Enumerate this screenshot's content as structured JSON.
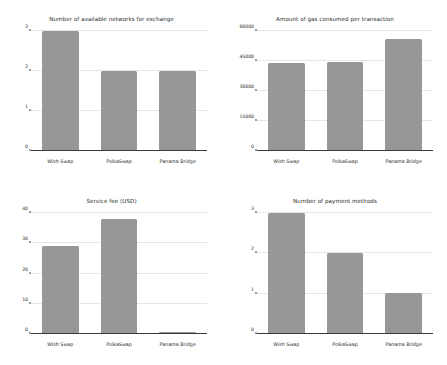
{
  "colors": {
    "bar": "#979797",
    "axis": "#3a3a3a",
    "grid": "#e6e6e6",
    "text": "#2b2b2b",
    "background": "#ffffff"
  },
  "categories": [
    "Wish Swap",
    "PolkaSwap",
    "Panama Bridge"
  ],
  "chart_data": [
    {
      "type": "bar",
      "title": "Number of available networks for exchange",
      "categories": [
        "Wish Swap",
        "PolkaSwap",
        "Panama Bridge"
      ],
      "values": [
        3,
        2,
        2
      ],
      "xlabel": "",
      "ylabel": "",
      "ylim": [
        0,
        3
      ],
      "yticks": [
        0,
        1,
        2,
        3
      ],
      "ytick_labels": [
        "0",
        "1",
        "2",
        "3"
      ],
      "grid": true,
      "legend": false
    },
    {
      "type": "bar",
      "title": "Amount of gas consumed per transaction",
      "categories": [
        "Wish Swap",
        "PolkaSwap",
        "Panama Bridge"
      ],
      "values": [
        44000,
        44500,
        56000
      ],
      "xlabel": "",
      "ylabel": "",
      "ylim": [
        0,
        60000
      ],
      "yticks": [
        0,
        15000,
        30000,
        45000,
        60000
      ],
      "ytick_labels": [
        "0",
        "15000",
        "30000",
        "45000",
        "60000"
      ],
      "grid": true,
      "legend": false
    },
    {
      "type": "bar",
      "title": "Service fee (USD)",
      "categories": [
        "Wish Swap",
        "PolkaSwap",
        "Panama Bridge"
      ],
      "values": [
        29,
        38,
        0.5
      ],
      "xlabel": "",
      "ylabel": "",
      "ylim": [
        0,
        40
      ],
      "yticks": [
        0,
        10,
        20,
        30,
        40
      ],
      "ytick_labels": [
        "0",
        "10",
        "20",
        "30",
        "40"
      ],
      "grid": true,
      "legend": false
    },
    {
      "type": "bar",
      "title": "Number of payment methods",
      "categories": [
        "Wish Swap",
        "PolkaSwap",
        "Panama Bridge"
      ],
      "values": [
        3,
        2,
        1
      ],
      "xlabel": "",
      "ylabel": "",
      "ylim": [
        0,
        3
      ],
      "yticks": [
        0,
        1,
        2,
        3
      ],
      "ytick_labels": [
        "0",
        "1",
        "2",
        "3"
      ],
      "grid": true,
      "legend": false
    }
  ]
}
